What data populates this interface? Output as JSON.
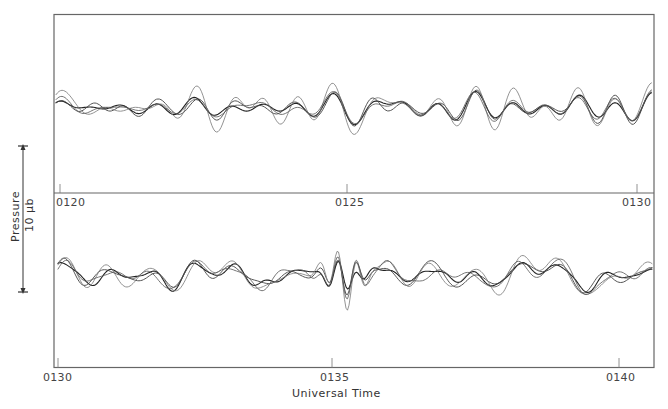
{
  "chart_data": {
    "type": "line",
    "title": "",
    "xlabel": "Universal Time",
    "ylabel": "Pressure",
    "scale_bar": {
      "label": "10 μb",
      "axis_label": "Pressure"
    },
    "grid": false,
    "legend": null,
    "panels": [
      {
        "name": "upper",
        "x_range": [
          "0120",
          "0130"
        ],
        "tick_labels": [
          "0120",
          "0125",
          "0130"
        ],
        "tick_minutes": [
          0,
          5,
          10
        ],
        "n_series": 4,
        "series": [
          {
            "name": "trace-1",
            "seed": 11,
            "amp": 1.0,
            "stroke": "#222222",
            "width": 1.1
          },
          {
            "name": "trace-2",
            "seed": 23,
            "amp": 1.2,
            "stroke": "#444444",
            "width": 0.9
          },
          {
            "name": "trace-3",
            "seed": 37,
            "amp": 1.7,
            "stroke": "#777777",
            "width": 0.8
          },
          {
            "name": "trace-4",
            "seed": 53,
            "amp": 1.1,
            "stroke": "#555555",
            "width": 0.8
          }
        ]
      },
      {
        "name": "lower",
        "x_range": [
          "0130",
          "0140"
        ],
        "tick_labels": [
          "0130",
          "0135",
          "0140"
        ],
        "tick_minutes": [
          0,
          5,
          10
        ],
        "n_series": 4,
        "series": [
          {
            "name": "trace-1",
            "seed": 71,
            "amp": 1.0,
            "stroke": "#222222",
            "width": 1.1
          },
          {
            "name": "trace-2",
            "seed": 83,
            "amp": 1.2,
            "stroke": "#444444",
            "width": 0.9
          },
          {
            "name": "trace-3",
            "seed": 97,
            "amp": 1.6,
            "stroke": "#777777",
            "width": 0.8
          },
          {
            "name": "trace-4",
            "seed": 109,
            "amp": 1.1,
            "stroke": "#555555",
            "width": 0.8
          }
        ],
        "notable_feature": "large common oscillation near 0135"
      }
    ]
  },
  "labels": {
    "upper_ticks": [
      "0120",
      "0125",
      "0130"
    ],
    "lower_ticks": [
      "0130",
      "0135",
      "0140"
    ],
    "x_title": "Universal Time",
    "scale_title": "Pressure",
    "scale_value": "10 μb"
  },
  "colors": {
    "frame": "#555555",
    "background": "#ffffff",
    "text": "#444444"
  }
}
